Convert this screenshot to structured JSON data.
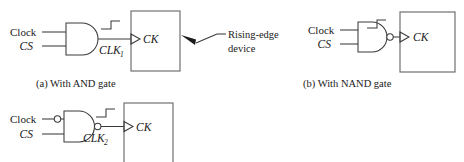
{
  "figure": {
    "kind": "logic-gate-clock-gating-diagram",
    "background_color": "#ffffff",
    "line_color": "#3a3a3a",
    "box_color": "#6b6b6b",
    "text_color": "#1a1a1a"
  },
  "panels": [
    {
      "id": "a",
      "caption": "(a) With AND gate",
      "gate": "AND",
      "inputs": [
        {
          "label": "Clock",
          "style": "roman",
          "inverted": false
        },
        {
          "label": "CS",
          "style": "italic",
          "inverted": false
        }
      ],
      "output_bubble": false,
      "output_label": "CLK",
      "output_label_sub": "1",
      "waveform": "rising-edge",
      "device_port_label": "CK",
      "annotation": {
        "line1": "Rising-edge",
        "line2": "device"
      }
    },
    {
      "id": "b",
      "caption": "(b) With NAND gate",
      "gate": "NAND",
      "inputs": [
        {
          "label": "Clock",
          "style": "roman",
          "inverted": false
        },
        {
          "label": "CS",
          "style": "italic",
          "inverted": false
        }
      ],
      "output_bubble": true,
      "output_label": "",
      "output_label_sub": "",
      "waveform": "rising-edge",
      "device_port_label": "CK",
      "annotation": null
    },
    {
      "id": "c",
      "caption": "",
      "gate": "NAND-with-inverted-clock-input",
      "inputs": [
        {
          "label": "Clock",
          "style": "roman",
          "inverted": true
        },
        {
          "label": "CS",
          "style": "italic",
          "inverted": false
        }
      ],
      "output_bubble": true,
      "output_label": "CLK",
      "output_label_sub": "2",
      "waveform": "rising-edge",
      "device_port_label": "CK",
      "annotation": null
    }
  ]
}
